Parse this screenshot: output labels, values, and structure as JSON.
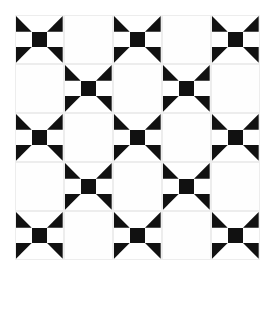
{
  "page": {
    "width": 272,
    "height": 318,
    "background_color": "#ffffff"
  },
  "palette": {
    "fabric_dark": "#111111",
    "fabric_light": "#ffffff",
    "seam_line": "#ededed",
    "empty_cell": "#fefefe"
  },
  "grid": {
    "rows": 5,
    "columns": 5,
    "cell_size": 49,
    "offset_x": 15,
    "offset_y": 15,
    "arrangement": "checkerboard",
    "block_count": 13,
    "empty_count": 12,
    "layout": [
      [
        "block",
        "empty",
        "block",
        "empty",
        "block"
      ],
      [
        "empty",
        "block",
        "empty",
        "block",
        "empty"
      ],
      [
        "block",
        "empty",
        "block",
        "empty",
        "block"
      ],
      [
        "empty",
        "block",
        "empty",
        "block",
        "empty"
      ],
      [
        "block",
        "empty",
        "block",
        "empty",
        "block"
      ]
    ]
  },
  "block": {
    "name": "pinwheel-churn-dash-block",
    "sub_rows": 3,
    "sub_columns": 3,
    "patches": [
      {
        "position": "top-left",
        "type": "half-square-triangle",
        "orientation": "lower-left",
        "color": "#111111"
      },
      {
        "position": "top-center",
        "type": "plain",
        "orientation": "none",
        "color": "#ffffff"
      },
      {
        "position": "top-right",
        "type": "half-square-triangle",
        "orientation": "lower-right",
        "color": "#111111"
      },
      {
        "position": "middle-left",
        "type": "plain",
        "orientation": "none",
        "color": "#ffffff"
      },
      {
        "position": "center",
        "type": "square",
        "orientation": "none",
        "color": "#111111"
      },
      {
        "position": "middle-right",
        "type": "plain",
        "orientation": "none",
        "color": "#ffffff"
      },
      {
        "position": "bottom-left",
        "type": "half-square-triangle",
        "orientation": "upper-left",
        "color": "#111111"
      },
      {
        "position": "bottom-center",
        "type": "plain",
        "orientation": "none",
        "color": "#ffffff"
      },
      {
        "position": "bottom-right",
        "type": "half-square-triangle",
        "orientation": "upper-right",
        "color": "#111111"
      }
    ]
  }
}
